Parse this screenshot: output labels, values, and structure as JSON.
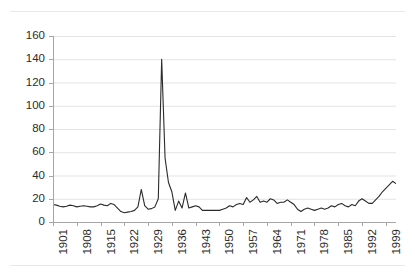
{
  "chart_data": {
    "type": "line",
    "title": "",
    "subtitle": "",
    "xlabel": "",
    "ylabel": "",
    "xlim": [
      1901,
      2002
    ],
    "ylim": [
      0,
      160
    ],
    "grid": true,
    "grid_axis": "y",
    "legend": "none",
    "line_color": "#2b2b2b",
    "grid_color": "#e3e3e3",
    "axis_color": "#a6a6a6",
    "background": "#ffffff",
    "yticks": [
      0,
      20,
      40,
      60,
      80,
      100,
      120,
      140,
      160
    ],
    "ytick_labels": [
      "0",
      "20",
      "40",
      "60",
      "80",
      "100",
      "120",
      "140",
      "160"
    ],
    "xticks": [
      1901,
      1908,
      1915,
      1922,
      1929,
      1936,
      1943,
      1950,
      1957,
      1964,
      1971,
      1978,
      1985,
      1992,
      1999
    ],
    "xtick_labels": [
      "1901",
      "1908",
      "1915",
      "1922",
      "1929",
      "1936",
      "1943",
      "1950",
      "1957",
      "1964",
      "1971",
      "1978",
      "1985",
      "1992",
      "1999"
    ],
    "xtick_rotation": 90,
    "xtick_interval": 7,
    "annotations": [],
    "series": [
      {
        "name": "series-1",
        "x": [
          1901,
          1902,
          1903,
          1904,
          1905,
          1906,
          1907,
          1908,
          1909,
          1910,
          1911,
          1912,
          1913,
          1914,
          1915,
          1916,
          1917,
          1918,
          1919,
          1920,
          1921,
          1922,
          1923,
          1924,
          1925,
          1926,
          1927,
          1928,
          1929,
          1930,
          1931,
          1932,
          1933,
          1934,
          1935,
          1936,
          1937,
          1938,
          1939,
          1940,
          1941,
          1942,
          1943,
          1944,
          1945,
          1946,
          1947,
          1948,
          1949,
          1950,
          1951,
          1952,
          1953,
          1954,
          1955,
          1956,
          1957,
          1958,
          1959,
          1960,
          1961,
          1962,
          1963,
          1964,
          1965,
          1966,
          1967,
          1968,
          1969,
          1970,
          1971,
          1972,
          1973,
          1974,
          1975,
          1976,
          1977,
          1978,
          1979,
          1980,
          1981,
          1982,
          1983,
          1984,
          1985,
          1986,
          1987,
          1988,
          1989,
          1990,
          1991,
          1992,
          1993,
          1994,
          1995,
          1996,
          1997,
          1998,
          1999,
          2000,
          2001,
          2002
        ],
        "values": [
          15,
          14,
          13,
          13,
          14,
          15,
          14,
          13,
          13.5,
          14,
          13.5,
          13,
          12.5,
          14,
          15,
          14.5,
          13.5,
          13,
          17,
          13,
          10,
          9,
          8.5,
          8,
          8.5,
          9,
          10.5,
          13,
          28,
          14,
          11,
          12,
          40,
          140,
          50,
          32,
          26,
          22,
          21,
          20,
          19,
          20,
          18,
          21,
          22,
          24,
          24,
          25,
          26,
          27,
          26,
          27,
          28,
          30,
          32,
          34,
          36,
          37,
          38,
          39,
          40,
          41,
          42,
          43,
          44,
          45,
          46,
          47,
          48,
          49,
          50,
          51,
          52,
          53,
          54,
          55,
          56,
          57,
          58,
          59,
          60,
          61,
          62,
          63,
          64,
          65,
          66,
          67,
          68,
          69,
          70,
          71,
          72,
          73,
          74,
          75,
          76,
          77,
          78,
          79,
          80,
          81
        ]
      }
    ],
    "series_plot": {
      "name": "series-1",
      "comment": "Normalized pixel-space polyline points (x%, value) used for rendering the visual curve.",
      "points": [
        [
          1901,
          15
        ],
        [
          1902,
          14.5
        ],
        [
          1903,
          13.5
        ],
        [
          1904,
          13
        ],
        [
          1905,
          13.5
        ],
        [
          1906,
          14.5
        ],
        [
          1907,
          14
        ],
        [
          1908,
          13
        ],
        [
          1909,
          13.5
        ],
        [
          1910,
          14
        ],
        [
          1911,
          13.5
        ],
        [
          1912,
          13
        ],
        [
          1913,
          13
        ],
        [
          1914,
          14
        ],
        [
          1915,
          15.5
        ],
        [
          1916,
          14.5
        ],
        [
          1917,
          14
        ],
        [
          1918,
          16
        ],
        [
          1919,
          15
        ],
        [
          1920,
          12
        ],
        [
          1921,
          9
        ],
        [
          1922,
          8
        ],
        [
          1923,
          8.5
        ],
        [
          1924,
          9
        ],
        [
          1925,
          10
        ],
        [
          1926,
          13
        ],
        [
          1927,
          28
        ],
        [
          1928,
          14
        ],
        [
          1929,
          11
        ],
        [
          1930,
          11.5
        ],
        [
          1931,
          13
        ],
        [
          1932,
          20
        ],
        [
          1933,
          140
        ],
        [
          1934,
          55
        ],
        [
          1935,
          34
        ],
        [
          1936,
          26
        ],
        [
          1937,
          10
        ],
        [
          1938,
          18
        ],
        [
          1939,
          12
        ],
        [
          1940,
          25
        ],
        [
          1941,
          12
        ],
        [
          1942,
          13
        ],
        [
          1943,
          14
        ],
        [
          1944,
          13
        ],
        [
          1945,
          10
        ],
        [
          1946,
          10
        ],
        [
          1947,
          10
        ],
        [
          1948,
          10
        ],
        [
          1949,
          10
        ],
        [
          1950,
          10
        ],
        [
          1951,
          11
        ],
        [
          1952,
          12
        ],
        [
          1953,
          14
        ],
        [
          1954,
          13
        ],
        [
          1955,
          15
        ],
        [
          1956,
          16
        ],
        [
          1957,
          15
        ],
        [
          1958,
          21
        ],
        [
          1959,
          17
        ],
        [
          1960,
          19
        ],
        [
          1961,
          22
        ],
        [
          1962,
          17
        ],
        [
          1963,
          18
        ],
        [
          1964,
          17
        ],
        [
          1965,
          20
        ],
        [
          1966,
          19
        ],
        [
          1967,
          16
        ],
        [
          1968,
          17
        ],
        [
          1969,
          17
        ],
        [
          1970,
          19
        ],
        [
          1971,
          17
        ],
        [
          1972,
          15
        ],
        [
          1973,
          11
        ],
        [
          1974,
          9
        ],
        [
          1975,
          11
        ],
        [
          1976,
          12
        ],
        [
          1977,
          11
        ],
        [
          1978,
          10
        ],
        [
          1979,
          11
        ],
        [
          1980,
          12
        ],
        [
          1981,
          11
        ],
        [
          1982,
          12
        ],
        [
          1983,
          14
        ],
        [
          1984,
          13
        ],
        [
          1985,
          15
        ],
        [
          1986,
          16
        ],
        [
          1987,
          14
        ],
        [
          1988,
          13
        ],
        [
          1989,
          15
        ],
        [
          1990,
          14
        ],
        [
          1991,
          18
        ],
        [
          1992,
          20
        ],
        [
          1993,
          18
        ],
        [
          1994,
          16
        ],
        [
          1995,
          16
        ],
        [
          1996,
          19
        ],
        [
          1997,
          22
        ],
        [
          1998,
          26
        ],
        [
          1999,
          29
        ],
        [
          2000,
          32
        ],
        [
          2001,
          35
        ],
        [
          2002,
          33
        ]
      ]
    },
    "peak": {
      "x": 1933,
      "y": 140,
      "label": ""
    },
    "min": {
      "x": 1923,
      "y": 8,
      "label": ""
    }
  }
}
